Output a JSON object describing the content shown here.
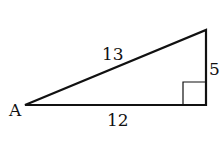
{
  "diagram": {
    "type": "right-triangle",
    "vertex_label": "A",
    "hypotenuse_label": "13",
    "opposite_label": "5",
    "adjacent_label": "12",
    "right_angle_marker": true,
    "stroke_color": "#111111"
  }
}
